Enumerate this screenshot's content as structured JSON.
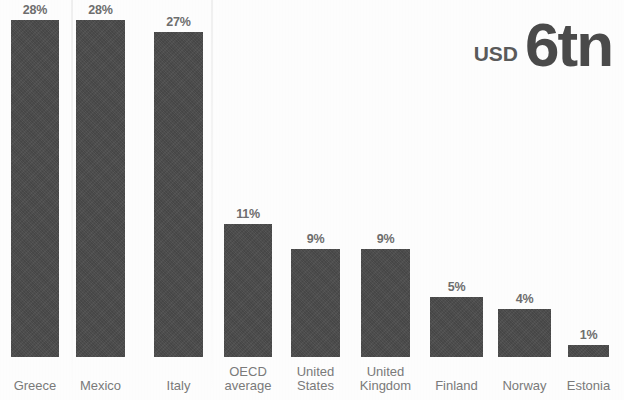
{
  "annotation": {
    "currency": "USD",
    "amount": "6tn"
  },
  "style": {
    "bar_color": "#4a4a4a",
    "label_color": "#7a7a7a",
    "value_color": "#6e6e6e",
    "background": "#fdfdfd"
  },
  "chart_data": {
    "type": "bar",
    "title": "",
    "subtitle": "",
    "xlabel": "",
    "ylabel": "",
    "ylim": [
      0,
      30
    ],
    "grid": false,
    "legend": "none",
    "value_suffix": "%",
    "annotations": [
      "USD 6tn"
    ],
    "categories": [
      "Greece",
      "Mexico",
      "Italy",
      "OECD\naverage",
      "United\nStates",
      "United\nKingdom",
      "Finland",
      "Norway",
      "Estonia"
    ],
    "values": [
      28,
      28,
      27,
      11,
      9,
      9,
      5,
      4,
      1
    ],
    "value_labels": [
      "28%",
      "28%",
      "27%",
      "11%",
      "9%",
      "9%",
      "5%",
      "4%",
      "1%"
    ],
    "bars": [
      {
        "category": "Greece",
        "label": "Greece",
        "value": 28,
        "value_label": "28%",
        "left": 11,
        "width": 48
      },
      {
        "category": "Mexico",
        "label": "Mexico",
        "value": 28,
        "value_label": "28%",
        "left": 76,
        "width": 49
      },
      {
        "category": "Italy",
        "label": "Italy",
        "value": 27,
        "value_label": "27%",
        "left": 154,
        "width": 49
      },
      {
        "category": "OECD average",
        "label": "OECD\naverage",
        "value": 11,
        "value_label": "11%",
        "left": 224,
        "width": 48
      },
      {
        "category": "United States",
        "label": "United\nStates",
        "value": 9,
        "value_label": "9%",
        "left": 291,
        "width": 49
      },
      {
        "category": "United Kingdom",
        "label": "United\nKingdom",
        "value": 9,
        "value_label": "9%",
        "left": 361,
        "width": 49
      },
      {
        "category": "Finland",
        "label": "Finland",
        "value": 5,
        "value_label": "5%",
        "left": 430,
        "width": 53
      },
      {
        "category": "Norway",
        "label": "Norway",
        "value": 4,
        "value_label": "4%",
        "left": 498,
        "width": 53
      },
      {
        "category": "Estonia",
        "label": "Estonia",
        "value": 1,
        "value_label": "1%",
        "left": 568,
        "width": 41
      }
    ]
  }
}
